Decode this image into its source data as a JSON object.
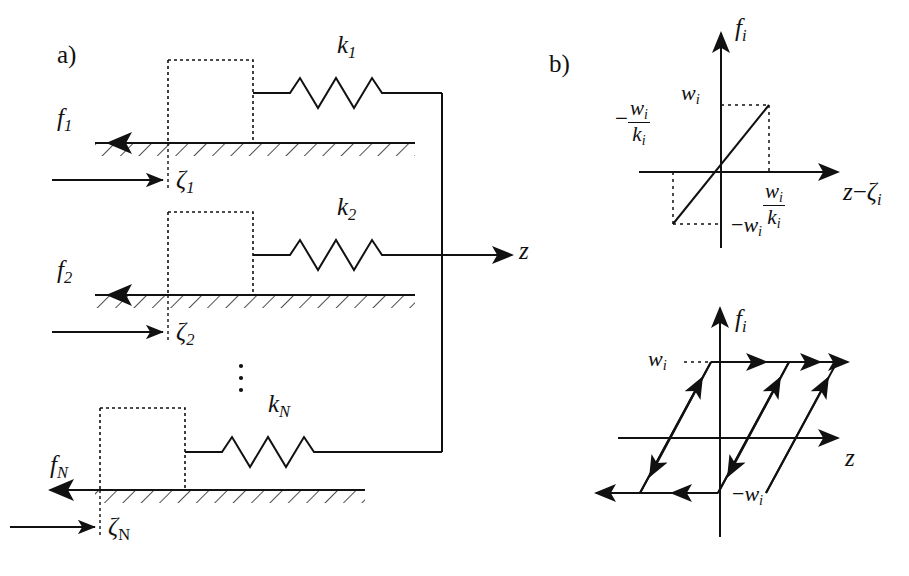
{
  "figure": {
    "panels": [
      {
        "id": "a",
        "label": "a)",
        "description": "Maxwell-slip model: N parallel mass-spring-friction elements attached to a common output z"
      },
      {
        "id": "b",
        "label": "b)",
        "description": "Element force characteristics: saturated linear spring law and hysteresis loop"
      }
    ]
  },
  "panel_a": {
    "label": "a)",
    "elements": [
      {
        "spring_label": "k",
        "spring_index": "1",
        "force_label": "f",
        "force_index": "1",
        "state_label": "ζ",
        "state_index": "1"
      },
      {
        "spring_label": "k",
        "spring_index": "2",
        "force_label": "f",
        "force_index": "2",
        "state_label": "ζ",
        "state_index": "2"
      },
      {
        "spring_label": "k",
        "spring_index": "N",
        "force_label": "f",
        "force_index": "N",
        "state_label": "ζ",
        "state_index": "N"
      }
    ],
    "ellipsis": "⋮",
    "output_label": "z",
    "output_arrow_direction": "right",
    "friction_arrow_direction": "left",
    "displacement_arrow_direction": "right",
    "block_style": "dashed-rectangle",
    "ground_style": "hatched"
  },
  "chart_top": {
    "type": "line",
    "title": "",
    "xlabel_parts": {
      "lead": "z",
      "minus": "−",
      "tail": "ζ",
      "tail_sub": "i"
    },
    "ylabel": "f",
    "ylabel_sub": "i",
    "ytick_pos": {
      "text": "w",
      "sub": "i"
    },
    "ytick_neg": {
      "minus": "−",
      "text": "w",
      "sub": "i"
    },
    "xtick_pos": {
      "num": "w",
      "num_sub": "i",
      "den": "k",
      "den_sub": "i"
    },
    "xtick_neg": {
      "minus": "−",
      "num": "w",
      "num_sub": "i",
      "den": "k",
      "den_sub": "i"
    },
    "series": [
      {
        "name": "saturated spring force",
        "x": [
          -2,
          -1,
          1,
          2
        ],
        "y": [
          -1,
          -1,
          1,
          1
        ]
      }
    ],
    "xlim": [
      -2.2,
      2.2
    ],
    "ylim": [
      -1.7,
      1.7
    ],
    "grid": false,
    "guides": "dotted",
    "legend": "none"
  },
  "chart_bottom": {
    "type": "line",
    "title": "",
    "xlabel": "z",
    "ylabel": "f",
    "ylabel_sub": "i",
    "ytick_pos": {
      "text": "w",
      "sub": "i"
    },
    "ytick_neg": {
      "minus": "−",
      "text": "w",
      "sub": "i"
    },
    "xlim": [
      -2.6,
      2.6
    ],
    "ylim": [
      -1.7,
      1.7
    ],
    "grid": false,
    "legend": "none",
    "branches": [
      {
        "name": "rising-branch-left",
        "direction": "up"
      },
      {
        "name": "rising-branch-middle",
        "direction": "up"
      },
      {
        "name": "rising-branch-right",
        "direction": "up"
      },
      {
        "name": "falling-branch-left",
        "direction": "down"
      },
      {
        "name": "falling-branch-middle",
        "direction": "down"
      },
      {
        "name": "saturation-top",
        "direction": "right"
      },
      {
        "name": "saturation-bottom",
        "direction": "left"
      }
    ]
  }
}
